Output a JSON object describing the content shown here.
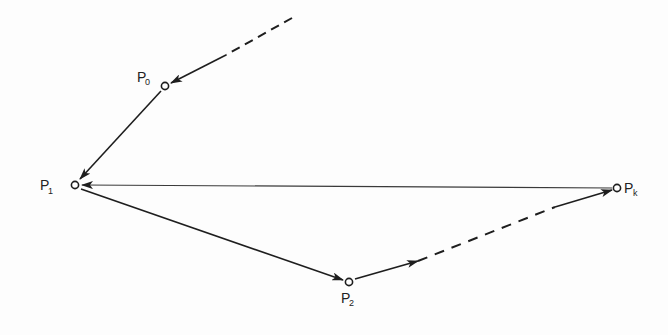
{
  "diagram": {
    "type": "directed-path-graph",
    "ink_color": "#1e1e1e",
    "faint_ink_color": "#555555",
    "nodes": [
      {
        "id": "P0",
        "label": "P",
        "subscript": "0",
        "x": 165,
        "y": 86
      },
      {
        "id": "P1",
        "label": "P",
        "subscript": "1",
        "x": 75,
        "y": 185
      },
      {
        "id": "P2",
        "label": "P",
        "subscript": "2",
        "x": 349,
        "y": 282
      },
      {
        "id": "Pk",
        "label": "P",
        "subscript": "k",
        "x": 617,
        "y": 188
      }
    ],
    "edges": [
      {
        "from": "offscreen",
        "to": "P0",
        "style": "dashed-then-solid"
      },
      {
        "from": "P0",
        "to": "P1",
        "style": "solid"
      },
      {
        "from": "P1",
        "to": "P2",
        "style": "solid"
      },
      {
        "from": "P2",
        "to": "Pk",
        "style": "dashed"
      },
      {
        "from": "Pk",
        "to": "P1",
        "style": "solid"
      }
    ]
  }
}
